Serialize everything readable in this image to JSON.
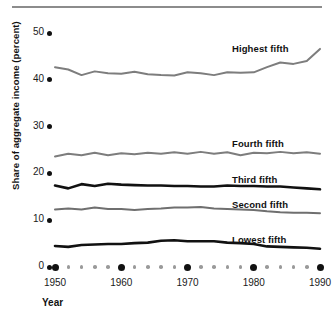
{
  "chart_data": {
    "type": "line",
    "title": "",
    "xlabel": "Year",
    "ylabel": "Share of aggregate income (percent)",
    "xlim": [
      1950,
      1990
    ],
    "ylim": [
      0,
      52
    ],
    "grid": false,
    "legend_position": "inline-right",
    "y_ticks": [
      0,
      10,
      20,
      30,
      40,
      50
    ],
    "y_tick_labels": [
      "0",
      "10",
      "20",
      "30",
      "40",
      "50"
    ],
    "x_ticks": [
      1950,
      1960,
      1970,
      1980,
      1990
    ],
    "x_tick_labels": [
      "1950",
      "1960",
      "1970",
      "1980",
      "1990"
    ],
    "x_minor_step": 2,
    "x": [
      1950,
      1952,
      1954,
      1956,
      1958,
      1960,
      1962,
      1964,
      1966,
      1968,
      1970,
      1972,
      1974,
      1976,
      1978,
      1980,
      1982,
      1984,
      1986,
      1988,
      1990
    ],
    "series": [
      {
        "name": "Highest fifth",
        "color": "#7d7d7d",
        "width": 2.0,
        "label": "Highest fifth",
        "values": [
          42.7,
          42.2,
          41.0,
          41.8,
          41.4,
          41.3,
          41.7,
          41.2,
          41.0,
          40.9,
          41.6,
          41.4,
          41.0,
          41.6,
          41.5,
          41.6,
          42.7,
          43.7,
          43.4,
          44.0,
          46.6
        ]
      },
      {
        "name": "Fourth fifth",
        "color": "#7d7d7d",
        "width": 2.0,
        "label": "Fourth fifth",
        "values": [
          23.6,
          24.2,
          23.9,
          24.4,
          23.9,
          24.3,
          24.1,
          24.4,
          24.2,
          24.5,
          24.2,
          24.6,
          24.2,
          24.5,
          23.9,
          24.4,
          24.3,
          24.6,
          24.3,
          24.5,
          24.2
        ]
      },
      {
        "name": "Third fifth",
        "color": "#111111",
        "width": 2.6,
        "label": "Third fifth",
        "values": [
          17.4,
          16.8,
          17.7,
          17.3,
          17.8,
          17.6,
          17.5,
          17.4,
          17.4,
          17.3,
          17.3,
          17.2,
          17.2,
          17.4,
          17.3,
          17.3,
          17.2,
          17.2,
          17.0,
          16.8,
          16.6
        ]
      },
      {
        "name": "Second fifth",
        "color": "#6f6f6f",
        "width": 2.0,
        "label": "Second fifth",
        "values": [
          12.3,
          12.5,
          12.3,
          12.7,
          12.4,
          12.4,
          12.2,
          12.4,
          12.5,
          12.7,
          12.7,
          12.8,
          12.5,
          12.4,
          12.3,
          12.2,
          11.9,
          11.7,
          11.6,
          11.6,
          11.5
        ]
      },
      {
        "name": "Lowest fifth",
        "color": "#111111",
        "width": 2.6,
        "label": "Lowest fifth",
        "values": [
          4.5,
          4.3,
          4.7,
          4.8,
          4.9,
          4.9,
          5.1,
          5.2,
          5.6,
          5.7,
          5.5,
          5.5,
          5.5,
          5.2,
          5.1,
          4.9,
          4.4,
          4.3,
          4.2,
          4.1,
          3.9
        ]
      }
    ]
  }
}
